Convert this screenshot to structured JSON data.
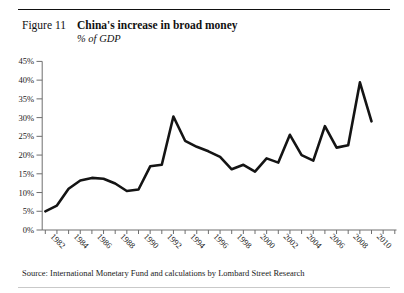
{
  "header": {
    "figure_label": "Figure 11"
  },
  "footer": {
    "source": "Source: International Monetary Fund and calculations by Lombard Street Research"
  },
  "chart_data": {
    "type": "line",
    "title": "China's increase in broad money",
    "subtitle": "% of GDP",
    "categories": [
      1982,
      1983,
      1984,
      1985,
      1986,
      1987,
      1988,
      1989,
      1990,
      1991,
      1992,
      1993,
      1994,
      1995,
      1996,
      1997,
      1998,
      1999,
      2000,
      2001,
      2002,
      2003,
      2004,
      2005,
      2006,
      2007,
      2008,
      2009,
      2010
    ],
    "values": [
      5.0,
      6.5,
      11.0,
      13.2,
      13.9,
      13.7,
      12.4,
      10.4,
      10.8,
      17.0,
      17.4,
      30.3,
      23.8,
      22.2,
      21.0,
      19.5,
      16.2,
      17.4,
      15.6,
      19.1,
      18.0,
      25.4,
      20.0,
      18.5,
      27.7,
      22.0,
      22.6,
      39.4,
      29.0
    ],
    "ylim": [
      0,
      45
    ],
    "y_tick_step": 5,
    "y_tick_labels": [
      "0%",
      "5%",
      "10%",
      "15%",
      "20%",
      "25%",
      "30%",
      "35%",
      "40%",
      "45%"
    ],
    "x_tick_labels": [
      "1982",
      "1984",
      "1986",
      "1988",
      "1990",
      "1992",
      "1994",
      "1996",
      "1998",
      "2000",
      "2002",
      "2004",
      "2006",
      "2008",
      "2010"
    ],
    "line_color": "#141414",
    "axis_color": "#6e6e6e",
    "grid": false,
    "legend": "none"
  }
}
